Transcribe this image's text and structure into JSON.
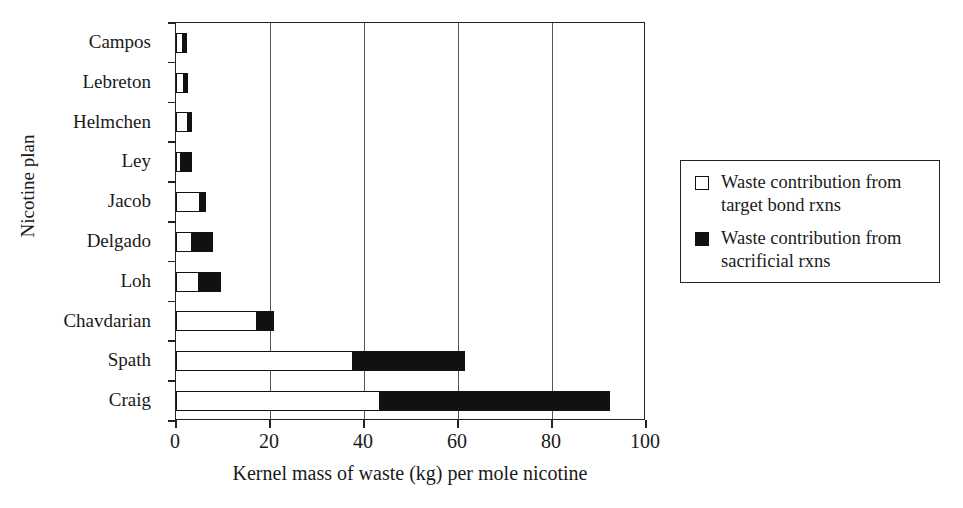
{
  "chart_data": {
    "type": "bar",
    "orientation": "horizontal",
    "stacked": true,
    "title": "",
    "xlabel": "Kernel mass of waste (kg) per mole nicotine",
    "ylabel": "Nicotine plan",
    "categories": [
      "Campos",
      "Lebreton",
      "Helmchen",
      "Ley",
      "Jacob",
      "Delgado",
      "Loh",
      "Chavdarian",
      "Spath",
      "Craig"
    ],
    "series": [
      {
        "name": "Waste contribution from target bond rxns",
        "color": "#ffffff",
        "values": [
          1.4,
          1.8,
          2.6,
          1.0,
          5.1,
          3.3,
          4.9,
          17.2,
          37.6,
          43.3
        ]
      },
      {
        "name": "Waste contribution from sacrificial rxns",
        "color": "#111111",
        "values": [
          0.2,
          0.2,
          0.1,
          2.5,
          1.3,
          4.6,
          4.7,
          3.6,
          23.9,
          49.1
        ]
      }
    ],
    "totals": [
      1.6,
      2.0,
      2.7,
      3.5,
      6.4,
      7.9,
      9.6,
      20.8,
      61.5,
      92.4
    ],
    "xlim": [
      0,
      100
    ],
    "xticks": [
      0,
      20,
      40,
      60,
      80,
      100
    ],
    "xtick_labels": [
      "0",
      "20",
      "40",
      "60",
      "80",
      "100"
    ],
    "grid": "vertical",
    "legend_position": "right-outside",
    "legend_entries": [
      "Waste contribution from\ntarget bond rxns",
      "Waste contribution from\nsacrificial rxns"
    ]
  },
  "axes": {
    "y_title": "Nicotine plan",
    "x_title": "Kernel mass of waste (kg) per mole nicotine"
  },
  "legend": {
    "items": [
      {
        "swatch": "open-square-swatch",
        "label": "Waste contribution from\ntarget bond rxns"
      },
      {
        "swatch": "filled-square-swatch",
        "label": "Waste contribution from\nsacrificial rxns"
      }
    ]
  }
}
